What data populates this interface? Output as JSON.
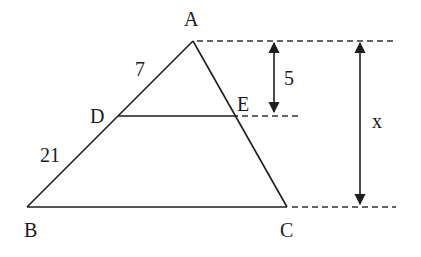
{
  "diagram": {
    "type": "similar-triangles",
    "points": {
      "A": {
        "label": "A",
        "x": 193,
        "y": 41
      },
      "B": {
        "label": "B",
        "x": 27,
        "y": 207
      },
      "C": {
        "label": "C",
        "x": 287,
        "y": 207
      },
      "D": {
        "label": "D",
        "x": 118,
        "y": 116
      },
      "E": {
        "label": "E",
        "x": 237,
        "y": 116
      }
    },
    "segment_labels": {
      "AD": "7",
      "DB": "21"
    },
    "measurements": {
      "small_height": "5",
      "large_height": "x"
    },
    "colors": {
      "line": "#1e1e1e",
      "background": "#ffffff"
    }
  }
}
